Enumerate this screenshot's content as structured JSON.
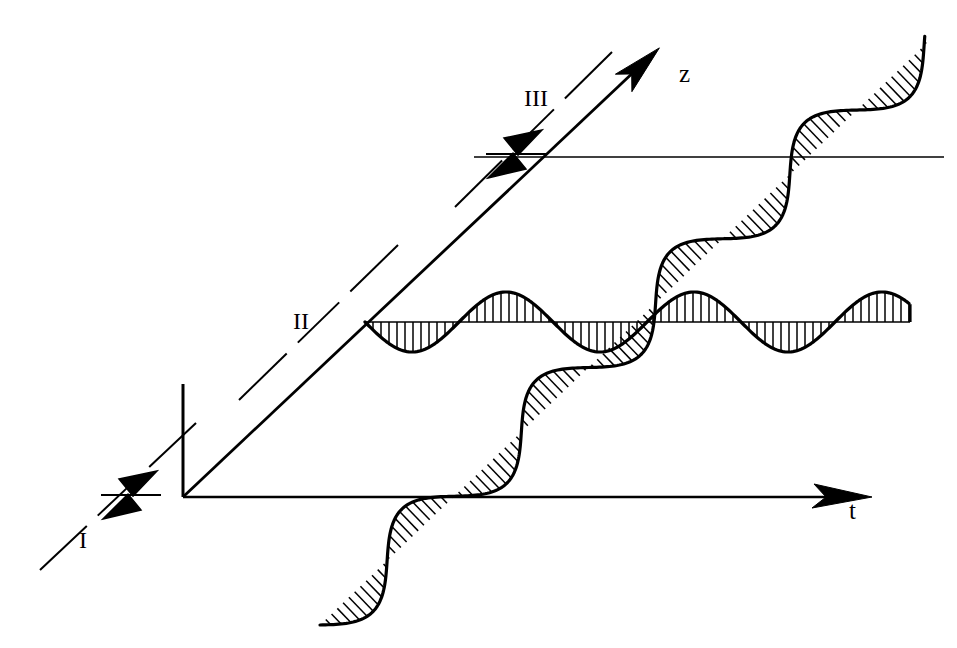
{
  "figure": {
    "type": "wave-propagation-spacetime-diagram",
    "background_color": "#ffffff",
    "ink_color": "#000000",
    "width": 957,
    "height": 648
  },
  "axes": {
    "horizontal": {
      "name": "t-axis",
      "label": "t",
      "x1": 183,
      "y1": 497,
      "x2": 862,
      "y2": 497,
      "arrow": "right",
      "stroke_width": 2.6
    },
    "diagonal": {
      "name": "z-axis",
      "label": "z",
      "x1": 183,
      "y1": 497,
      "x2": 655,
      "y2": 52,
      "arrow": "up-right",
      "stroke_width": 2.8
    },
    "vertical_stub": {
      "name": "vertical-axis-stub",
      "x1": 183,
      "y1": 497,
      "x2": 183,
      "y2": 384,
      "stroke_width": 3.0
    },
    "upper_horizontal": {
      "name": "upper-reference-line",
      "x1": 474,
      "y1": 157,
      "x2": 944,
      "y2": 157,
      "stroke_width": 1.4
    }
  },
  "planes": [
    {
      "id": "I",
      "label": "I",
      "label_x": 88,
      "label_y": 545,
      "dash_x1": 40,
      "dash_y1": 570,
      "dash_x2": 196,
      "dash_y2": 423,
      "marker_x": 131,
      "marker_y": 495,
      "marker": "double-arrowhead"
    },
    {
      "id": "II",
      "label": "II",
      "label_x": 305,
      "label_y": 327,
      "dash_x1": 239,
      "dash_y1": 400,
      "dash_x2": 398,
      "dash_y2": 245,
      "marker": "none"
    },
    {
      "id": "III",
      "label": "III",
      "label_x": 540,
      "label_y": 105,
      "dash_x1": 455,
      "dash_y1": 207,
      "dash_x2": 612,
      "dash_y2": 52,
      "marker_x": 516,
      "marker_y": 154,
      "marker": "double-arrowhead"
    }
  ],
  "waves": [
    {
      "id": "transverse-wave-t",
      "orientation": "horizontal",
      "baseline_y": 322,
      "x_start": 365,
      "x_end": 910,
      "wavelength": 188,
      "amplitude": 30,
      "phase_deg": 180,
      "hatching": "vertical-lines",
      "hatch_spacing": 8,
      "stroke_width": 3.2
    },
    {
      "id": "longitudinal-wave-z",
      "orientation": "diagonal",
      "angle_deg": -43,
      "x_start": 320,
      "y_start": 625,
      "x_end": 930,
      "y_end": 40,
      "wavelength": 186,
      "amplitude": 27,
      "phase_deg": 0,
      "hatching": "perpendicular-lines",
      "hatch_spacing": 8,
      "stroke_width": 3.2
    }
  ]
}
